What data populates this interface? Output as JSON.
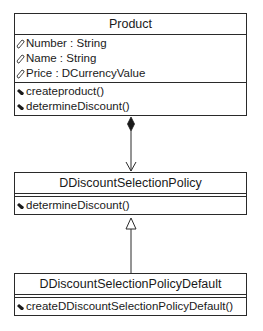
{
  "diagram": {
    "type": "uml-class-diagram",
    "classes": [
      {
        "name": "Product",
        "attributes": [
          {
            "icon": "attribute-icon",
            "text": "Number : String"
          },
          {
            "icon": "attribute-icon",
            "text": "Name : String"
          },
          {
            "icon": "attribute-icon",
            "text": "Price : DCurrencyValue"
          }
        ],
        "operations": [
          {
            "icon": "operation-icon",
            "text": "createproduct()"
          },
          {
            "icon": "operation-icon",
            "text": "determineDiscount()"
          }
        ]
      },
      {
        "name": "DDiscountSelectionPolicy",
        "attributes": [],
        "operations": [
          {
            "icon": "operation-icon",
            "text": "determineDiscount()"
          }
        ]
      },
      {
        "name": "DDiscountSelectionPolicyDefault",
        "attributes": [],
        "operations": [
          {
            "icon": "operation-icon",
            "text": "createDDiscountSelectionPolicyDefault()"
          }
        ]
      }
    ],
    "relationships": [
      {
        "type": "composition",
        "from": "Product",
        "to": "DDiscountSelectionPolicy",
        "whole_end": "filled-diamond",
        "part_end": "open-arrow"
      },
      {
        "type": "generalization",
        "from": "DDiscountSelectionPolicyDefault",
        "to": "DDiscountSelectionPolicy",
        "end": "hollow-triangle"
      }
    ],
    "colors": {
      "line": "#2a2a2a",
      "background": "#ffffff",
      "text": "#1a1a1a"
    }
  }
}
